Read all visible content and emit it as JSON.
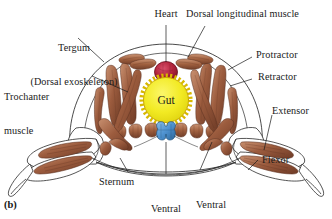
{
  "figure": {
    "panel_label": "(b)",
    "caption_title": "Arthropod body cross-section musculature"
  },
  "labels": {
    "tergum": "Tergum\n(Dorsal exoskeleton)",
    "tergum_line1": "Tergum",
    "tergum_line2": "(Dorsal exoskeleton)",
    "heart": "Heart",
    "dorsal_longitudinal_muscle": "Dorsal longitudinal muscle",
    "protractor": "Protractor",
    "retractor": "Retractor",
    "extensor": "Extensor",
    "flexor": "Flexor",
    "trochanter_muscle": "Trochanter\nmuscle",
    "trochanter_line1": "Trochanter",
    "trochanter_line2": "muscle",
    "sternum": "Sternum",
    "ventral_nerve_cord": "Ventral\nnerve\ncord",
    "vnc_line1": "Ventral",
    "vnc_line2": "nerve",
    "vnc_line3": "cord",
    "ventral_longitudinal_muscle": "Ventral\nlongitudinal\nmuscle",
    "vlm_line1": "Ventral",
    "vlm_line2": "longitudinal",
    "vlm_line3": "muscle",
    "gut": "Gut"
  },
  "structures": [
    {
      "name": "tergum",
      "kind": "exoskeleton",
      "label": "Tergum (Dorsal exoskeleton)"
    },
    {
      "name": "heart",
      "kind": "organ",
      "label": "Heart",
      "color": "#b2243c"
    },
    {
      "name": "gut",
      "kind": "organ",
      "label": "Gut",
      "color": "#f2ea23"
    },
    {
      "name": "dorsal-longitudinal-muscle",
      "kind": "muscle",
      "label": "Dorsal longitudinal muscle"
    },
    {
      "name": "ventral-longitudinal-muscle",
      "kind": "muscle",
      "label": "Ventral longitudinal muscle"
    },
    {
      "name": "protractor",
      "kind": "muscle",
      "label": "Protractor"
    },
    {
      "name": "retractor",
      "kind": "muscle",
      "label": "Retractor"
    },
    {
      "name": "trochanter-muscle",
      "kind": "muscle",
      "label": "Trochanter muscle"
    },
    {
      "name": "extensor",
      "kind": "muscle",
      "label": "Extensor"
    },
    {
      "name": "flexor",
      "kind": "muscle",
      "label": "Flexor"
    },
    {
      "name": "sternum",
      "kind": "exoskeleton",
      "label": "Sternum"
    },
    {
      "name": "ventral-nerve-cord",
      "kind": "nervous",
      "label": "Ventral nerve cord",
      "color": "#4f93d1"
    }
  ],
  "colors": {
    "muscle_fill": "#9a5a3c",
    "muscle_light": "#c08a68",
    "muscle_dark": "#6e3b26",
    "gut_yellow": "#f2ea23",
    "gut_rim": "#d8b800",
    "heart_red": "#b2243c",
    "heart_dark": "#7d1228",
    "nerve_blue": "#4f93d1",
    "nerve_dark": "#2c6699",
    "outline": "#2b2b2b",
    "background": "#ffffff",
    "text": "#1a1a1a"
  }
}
